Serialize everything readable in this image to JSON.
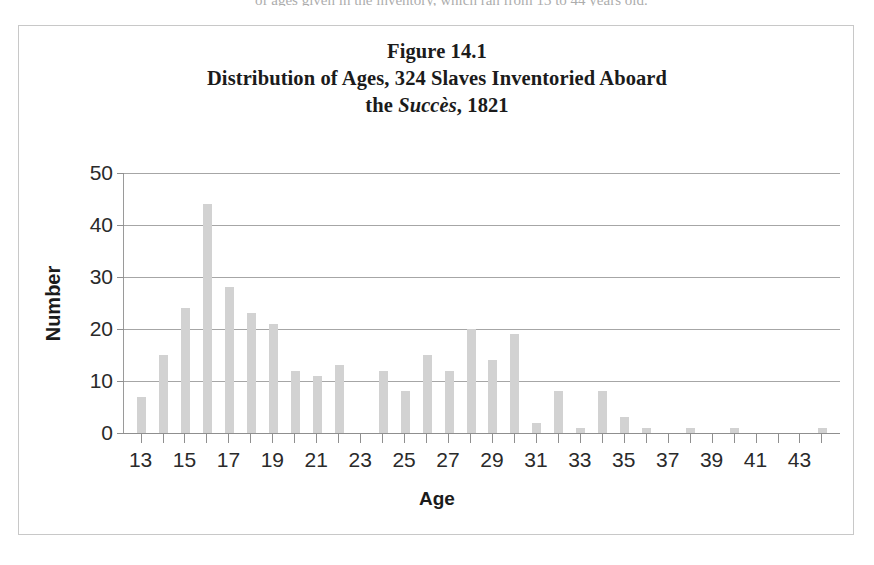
{
  "figure": {
    "title_line1": "Figure 14.1",
    "title_line2_a": "Distribution of Ages, 324 Slaves Inventoried Aboard",
    "title_line3_a": "the ",
    "title_line3_ship": "Succès",
    "title_line3_b": ", 1821",
    "scan_artifact_text": "of ages given in the inventory, which ran from 13 to 44 years old."
  },
  "colors": {
    "bar_fill": "#d2d2d2",
    "gridline": "#a6a6a6",
    "axis_line": "#8f8f8f",
    "frame_border": "#c8c8c8",
    "text": "#1b1b1b",
    "background": "#ffffff"
  },
  "chart_data": {
    "type": "bar",
    "xlabel": "Age",
    "ylabel": "Number",
    "xlim": [
      12.2,
      44.8
    ],
    "ylim": [
      0,
      50
    ],
    "yticks": [
      0,
      10,
      20,
      30,
      40,
      50
    ],
    "ytick_labels": [
      "0",
      "10",
      "20",
      "30",
      "40",
      "50"
    ],
    "xticks": [
      13,
      14,
      15,
      16,
      17,
      18,
      19,
      20,
      21,
      22,
      23,
      24,
      25,
      26,
      27,
      28,
      29,
      30,
      31,
      32,
      33,
      34,
      35,
      36,
      37,
      38,
      39,
      40,
      41,
      42,
      43,
      44
    ],
    "xtick_labels_shown": [
      "13",
      "15",
      "17",
      "19",
      "21",
      "23",
      "25",
      "27",
      "29",
      "31",
      "33",
      "35",
      "37",
      "39",
      "41",
      "43"
    ],
    "xtick_label_values": [
      13,
      15,
      17,
      19,
      21,
      23,
      25,
      27,
      29,
      31,
      33,
      35,
      37,
      39,
      41,
      43
    ],
    "grid": true,
    "grid_axis": "y",
    "legend": false,
    "total_count": 324,
    "categories": [
      13,
      14,
      15,
      16,
      17,
      18,
      19,
      20,
      21,
      22,
      23,
      24,
      25,
      26,
      27,
      28,
      29,
      30,
      31,
      32,
      33,
      34,
      35,
      36,
      37,
      38,
      39,
      40,
      41,
      42,
      43,
      44
    ],
    "values": [
      7,
      15,
      24,
      44,
      28,
      23,
      21,
      12,
      11,
      13,
      0,
      12,
      8,
      15,
      12,
      20,
      14,
      19,
      2,
      8,
      1,
      8,
      3,
      1,
      0,
      1,
      0,
      1,
      0,
      0,
      0,
      1
    ]
  },
  "axis": {
    "y_title": "Number",
    "x_title": "Age"
  }
}
